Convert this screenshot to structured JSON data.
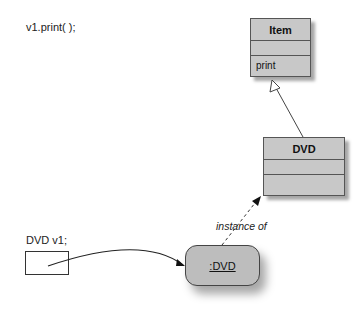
{
  "code_lines": {
    "method_call": "v1.print( );",
    "declaration": "DVD v1;"
  },
  "classes": {
    "item": {
      "name": "Item",
      "fields": "",
      "methods": "print"
    },
    "dvd": {
      "name": "DVD",
      "fields": "",
      "methods": ""
    }
  },
  "object": {
    "label": ":DVD"
  },
  "relations": {
    "instance_of": "instance of",
    "inheritance": "DVD extends Item"
  },
  "colors": {
    "class_fill": "#c8c8c8",
    "object_fill": "#bdbdbd",
    "line": "#333333"
  }
}
